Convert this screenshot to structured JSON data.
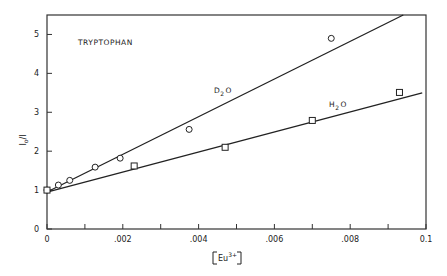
{
  "chart_data": {
    "type": "scatter",
    "title": "",
    "annotation": "TRYPTOPHAN",
    "xlabel": "[Eu3+]",
    "ylabel": "I0/I",
    "xlim": [
      0,
      0.01
    ],
    "ylim": [
      0,
      5.5
    ],
    "x_ticks": [
      "0",
      ".002",
      ".004",
      ".006",
      ".008",
      "0.1"
    ],
    "y_ticks": [
      "0",
      "1",
      "2",
      "3",
      "4",
      "5"
    ],
    "grid": false,
    "legend": "inline labels",
    "series": [
      {
        "name": "D2O",
        "marker": "circle",
        "x": [
          0.0,
          0.0003,
          0.0006,
          0.00127,
          0.00193,
          0.00375,
          0.0075
        ],
        "y": [
          1.0,
          1.13,
          1.25,
          1.59,
          1.82,
          2.56,
          4.9
        ],
        "fit_line": {
          "x": [
            0.0,
            0.0094
          ],
          "y": [
            0.95,
            5.5
          ]
        }
      },
      {
        "name": "H2O",
        "marker": "square",
        "x": [
          0.0,
          0.0023,
          0.0047,
          0.007,
          0.0093
        ],
        "y": [
          1.0,
          1.62,
          2.1,
          2.79,
          3.51
        ],
        "fit_line": {
          "x": [
            0.0,
            0.0099
          ],
          "y": [
            0.95,
            3.5
          ]
        }
      }
    ]
  },
  "labels": {
    "annotation": "TRYPTOPHAN",
    "d2o": "D",
    "d2o_sub": "2",
    "d2o_tail": "O",
    "h2o": "H",
    "h2o_sub": "2",
    "h2o_tail": "O",
    "ylabel_main": "I",
    "ylabel_sub": "o",
    "ylabel_tail": "/I",
    "xlabel_main": "Eu",
    "xlabel_sup": "3+"
  }
}
